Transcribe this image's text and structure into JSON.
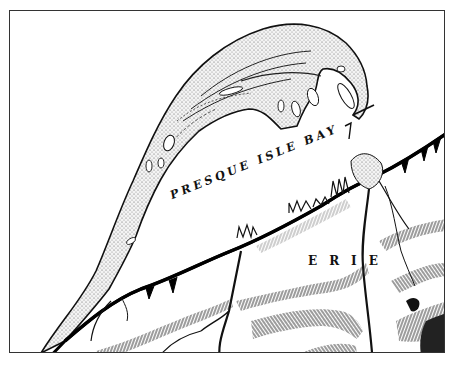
{
  "map": {
    "style": "historical engraved map",
    "labels": {
      "bay": "PRESQUE ISLE BAY",
      "city": "ERIE"
    },
    "features": {
      "peninsula": "Presque Isle peninsula (hooked sand spit, stippled)",
      "water_body": "Presque Isle Bay",
      "shoreline": "south shore with wharves/piers",
      "terrain": "hachured ridges and ravines",
      "streams": "creeks draining into bay"
    },
    "colors": {
      "ink": "#111111",
      "paper": "#ffffff",
      "frame": "#333333"
    }
  }
}
